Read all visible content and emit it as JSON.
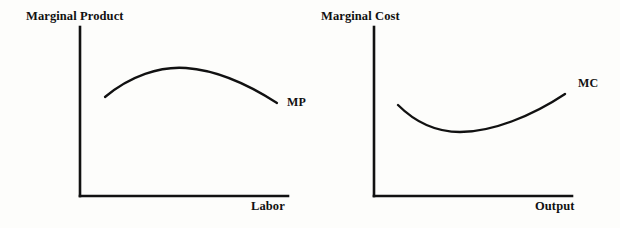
{
  "figure": {
    "background_color": "#fdfdfb",
    "ink_color": "#111111",
    "panel_count": 2
  },
  "panels": [
    {
      "id": "marginal-product",
      "y_axis_title": "Marginal Product",
      "x_axis_title": "Labor",
      "curve_label": "MP"
    },
    {
      "id": "marginal-cost",
      "y_axis_title": "Marginal Cost",
      "x_axis_title": "Output",
      "curve_label": "MC"
    }
  ],
  "chart_data": [
    {
      "type": "line",
      "title": "",
      "ylabel": "Marginal Product",
      "xlabel": "Labor",
      "series": [
        {
          "name": "MP",
          "shape": "concave-inverted-u",
          "x": [
            0.1,
            0.2,
            0.3,
            0.4,
            0.45,
            0.5,
            0.6,
            0.7,
            0.8,
            0.9,
            1.0
          ],
          "y": [
            0.59,
            0.7,
            0.78,
            0.84,
            0.855,
            0.86,
            0.845,
            0.8,
            0.73,
            0.64,
            0.55
          ]
        }
      ],
      "xlim": [
        0,
        1
      ],
      "ylim": [
        0,
        1
      ],
      "grid": false,
      "ticks": false,
      "legend": "inline-curve-label",
      "annotations": [
        "MP"
      ]
    },
    {
      "type": "line",
      "title": "",
      "ylabel": "Marginal Cost",
      "xlabel": "Output",
      "series": [
        {
          "name": "MC",
          "shape": "convex-u",
          "x": [
            0.12,
            0.22,
            0.32,
            0.42,
            0.5,
            0.58,
            0.68,
            0.78,
            0.88,
            0.96
          ],
          "y": [
            0.54,
            0.44,
            0.385,
            0.365,
            0.375,
            0.41,
            0.48,
            0.565,
            0.645,
            0.7
          ]
        }
      ],
      "xlim": [
        0,
        1
      ],
      "ylim": [
        0,
        1
      ],
      "grid": false,
      "ticks": false,
      "legend": "inline-curve-label",
      "annotations": [
        "MC"
      ]
    }
  ]
}
